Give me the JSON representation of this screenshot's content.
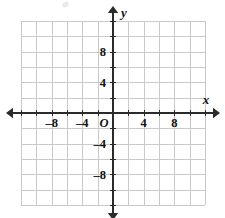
{
  "figure": {
    "kind": "coordinate-plane",
    "background_color": "#ffffff",
    "grid_color": "#c9c9c9",
    "axis_color": "#2b2b2b",
    "label_color": "#111111"
  },
  "chart_data": {
    "type": "scatter",
    "title": "",
    "subtitle": "",
    "xlabel": "x",
    "ylabel": "y",
    "xlim": [
      -12,
      12
    ],
    "ylim": [
      -12,
      12
    ],
    "grid": true,
    "grid_step": 2,
    "tick_step": 2,
    "legend": null,
    "origin_label": "O",
    "x_tick_values": [
      -12,
      -10,
      -8,
      -6,
      -4,
      -2,
      2,
      4,
      6,
      8,
      10,
      12
    ],
    "y_tick_values": [
      -12,
      -10,
      -8,
      -6,
      -4,
      -2,
      2,
      4,
      6,
      8,
      10,
      12
    ],
    "x_labeled_ticks": [
      {
        "value": -8,
        "text": "–8"
      },
      {
        "value": -4,
        "text": "–4"
      },
      {
        "value": 4,
        "text": "4"
      },
      {
        "value": 8,
        "text": "8"
      }
    ],
    "y_labeled_ticks": [
      {
        "value": 8,
        "text": "8"
      },
      {
        "value": 4,
        "text": "4"
      },
      {
        "value": -4,
        "text": "–4"
      },
      {
        "value": -8,
        "text": "–8"
      }
    ],
    "series": [],
    "values": [],
    "categories": [],
    "annotations": []
  },
  "axis_names": {
    "x": "x",
    "y": "y"
  }
}
